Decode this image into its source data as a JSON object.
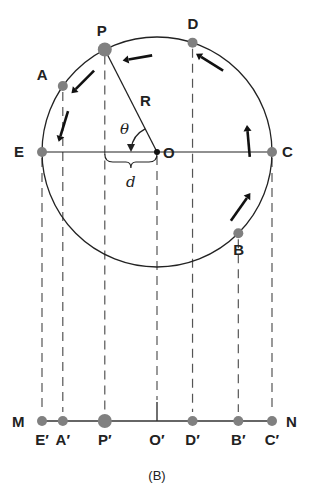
{
  "diagram": {
    "caption": "(B)",
    "circle": {
      "center_label": "O",
      "radius_label": "R",
      "angle_label": "θ",
      "displacement_label": "d",
      "rotation_direction": "counterclockwise"
    },
    "circle_points": [
      {
        "id": "P",
        "label": "P",
        "angle_deg": 117,
        "highlight": true
      },
      {
        "id": "A",
        "label": "A",
        "angle_deg": 145,
        "highlight": false
      },
      {
        "id": "E",
        "label": "E",
        "angle_deg": 180,
        "highlight": false
      },
      {
        "id": "D",
        "label": "D",
        "angle_deg": 72,
        "highlight": false
      },
      {
        "id": "C",
        "label": "C",
        "angle_deg": 0,
        "highlight": false
      },
      {
        "id": "B",
        "label": "B",
        "angle_deg": -45,
        "highlight": false
      }
    ],
    "line": {
      "left_label": "M",
      "right_label": "N",
      "projections": [
        {
          "id": "E",
          "label": "E′"
        },
        {
          "id": "A",
          "label": "A′"
        },
        {
          "id": "P",
          "label": "P′"
        },
        {
          "id": "O",
          "label": "O′"
        },
        {
          "id": "D",
          "label": "D′"
        },
        {
          "id": "B",
          "label": "B′"
        },
        {
          "id": "C",
          "label": "C′"
        }
      ]
    },
    "colors": {
      "ink": "#222222",
      "dot": "#808080",
      "dashed": "#555555"
    }
  }
}
